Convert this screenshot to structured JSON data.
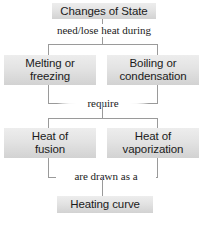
{
  "diagram": {
    "type": "flowchart",
    "accent_color": "#e3e3e3",
    "line_color": "#9a9a9a",
    "text_color": "#1b1b1b",
    "nodes": {
      "root": "Changes of State",
      "left_branch": "Melting or\nfreezing",
      "right_branch": "Boiling or\ncondensation",
      "left_result": "Heat of\nfusion",
      "right_result": "Heat of\nvaporization",
      "final": "Heating curve"
    },
    "edge_labels": {
      "root_to_branches": "need/lose heat during",
      "branches_to_results": "require",
      "results_to_final": "are drawn as a"
    }
  }
}
